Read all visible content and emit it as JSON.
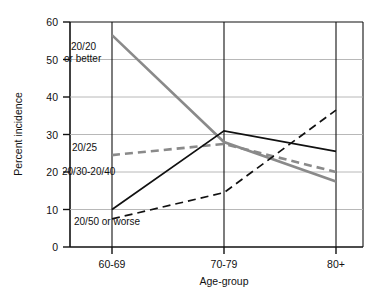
{
  "chart_data": {
    "type": "line",
    "title": "",
    "xlabel": "Age-group",
    "ylabel": "Percent incidence",
    "categories": [
      "60-69",
      "70-79",
      "80+"
    ],
    "ylim": [
      0,
      60
    ],
    "yticks": [
      0,
      10,
      20,
      30,
      40,
      50,
      60
    ],
    "grid": true,
    "legend_position": "inline-annotations",
    "series": [
      {
        "name": "20/20 or better",
        "label": "20/20",
        "label_line2": "or better",
        "style": "solid",
        "color": "#8a8a8a",
        "values": [
          56.5,
          28.0,
          17.5
        ]
      },
      {
        "name": "20/25",
        "label": "20/25",
        "style": "dashed",
        "color": "#8a8a8a",
        "values": [
          24.5,
          27.5,
          20.0
        ]
      },
      {
        "name": "20/30-20/40",
        "label": "20/30-20/40",
        "style": "solid",
        "color": "#111111",
        "values": [
          10.0,
          31.0,
          25.5
        ]
      },
      {
        "name": "20/50 or worse",
        "label": "20/50 or worse",
        "style": "dashed",
        "color": "#111111",
        "values": [
          7.5,
          14.5,
          36.5
        ]
      }
    ]
  },
  "axis": {
    "y_title": "Percent incidence",
    "x_title": "Age-group",
    "y_tick_0": "0",
    "y_tick_10": "10",
    "y_tick_20": "20",
    "y_tick_30": "30",
    "y_tick_40": "40",
    "y_tick_50": "50",
    "y_tick_60": "60",
    "x_tick_1": "60-69",
    "x_tick_2": "70-79",
    "x_tick_3": "80+"
  },
  "annotations": {
    "a1_line1": "20/20",
    "a1_line2": "or better",
    "a2": "20/25",
    "a3": "20/30-20/40",
    "a4": "20/50 or worse"
  },
  "colors": {
    "gray_series": "#8a8a8a",
    "black_series": "#111111",
    "grid": "#b8b8b8",
    "axis": "#111111"
  }
}
